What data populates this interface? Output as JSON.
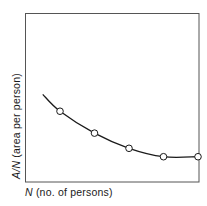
{
  "chart_data": {
    "type": "line",
    "title": "",
    "xlabel": "N (no. of persons)",
    "ylabel": "A/N (area per person)",
    "xlabel_parts": {
      "var": "N",
      "rest": " (no. of persons)"
    },
    "ylabel_parts": {
      "var": "A/N",
      "rest": " (area per person)"
    },
    "x_ticks": [],
    "y_ticks": [],
    "grid": false,
    "legend": null,
    "series": [
      {
        "name": "A/N",
        "curve_start": {
          "x": 0.5,
          "y": 0.52
        },
        "x": [
          1,
          2,
          3,
          4,
          5
        ],
        "y": [
          0.42,
          0.29,
          0.2,
          0.15,
          0.15
        ],
        "markers": "open-circle"
      }
    ],
    "xlim": [
      0,
      5
    ],
    "ylim": [
      0,
      1
    ]
  },
  "colors": {
    "axes": "#555555",
    "line": "#1a1a1a",
    "marker_fill": "#ffffff"
  }
}
